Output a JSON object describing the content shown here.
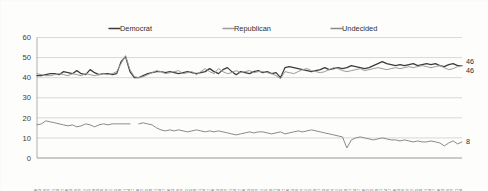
{
  "chart_data": {
    "type": "line",
    "title": "",
    "xlabel": "",
    "ylabel": "",
    "ylim": [
      0,
      60
    ],
    "yticks": [
      0,
      10,
      20,
      30,
      40,
      50,
      60
    ],
    "grid": true,
    "legend_position": "top",
    "legend": [
      "Democrat",
      "Republican",
      "Undecided"
    ],
    "end_labels": [
      {
        "series": "Democrat",
        "value": "46"
      },
      {
        "series": "Republican",
        "value": "46"
      },
      {
        "series": "Undecided",
        "value": "8"
      }
    ],
    "categories": [
      "1/20",
      "1/23",
      "1/26",
      "1/29",
      "2/1",
      "2/4",
      "2/7",
      "2/10",
      "2/13",
      "2/16",
      "2/19",
      "2/22",
      "2/25",
      "2/28",
      "3/3",
      "3/6",
      "3/9",
      "3/12",
      "3/15",
      "3/18",
      "3/21",
      "3/24",
      "3/27",
      "3/30",
      "4/2",
      "4/5",
      "4/8",
      "4/11",
      "4/14",
      "4/17",
      "4/20",
      "4/23",
      "4/26",
      "4/29",
      "5/2",
      "5/5",
      "5/8",
      "5/11",
      "5/14",
      "5/17",
      "5/20",
      "5/23",
      "5/26",
      "5/29",
      "6/1",
      "6/4",
      "6/7",
      "6/10",
      "6/13",
      "6/16",
      "6/19",
      "6/22",
      "6/25",
      "6/28",
      "7/1",
      "7/4",
      "7/7",
      "7/10",
      "7/13",
      "7/16",
      "7/19",
      "7/22",
      "7/25",
      "7/28",
      "7/31",
      "8/3",
      "8/6",
      "8/9",
      "8/12",
      "8/15",
      "8/18",
      "8/21",
      "8/24",
      "8/27",
      "8/30",
      "9/2",
      "9/5",
      "9/8",
      "9/11",
      "9/14",
      "9/17",
      "9/20",
      "9/23",
      "9/26",
      "9/29",
      "10/2",
      "10/5",
      "10/8",
      "10/11",
      "10/14",
      "10/17",
      "10/20",
      "10/23",
      "10/26",
      "10/29",
      "11/1",
      "11/4"
    ],
    "series": [
      {
        "name": "Democrat",
        "color": "#3c3c3c",
        "values": [
          41,
          41,
          41.5,
          42,
          42,
          41.5,
          43,
          42.5,
          42,
          43.5,
          42,
          41.5,
          44,
          42.5,
          41.5,
          42,
          42,
          41.5,
          42,
          48,
          50.5,
          43,
          40,
          40,
          41,
          42,
          42.5,
          43,
          43,
          42.5,
          43,
          42.5,
          42,
          42.5,
          43,
          42.5,
          42,
          42.5,
          43,
          44.5,
          43,
          42,
          44,
          45,
          43,
          41.5,
          43,
          42.5,
          42,
          43,
          43.5,
          42.5,
          43,
          42,
          42.5,
          40,
          45,
          45.5,
          45,
          44.5,
          44,
          43.5,
          43,
          43.5,
          44,
          45,
          44,
          44.5,
          45,
          44.5,
          45,
          46,
          45.5,
          45,
          44.5,
          45,
          46,
          47,
          48,
          47,
          46.5,
          46,
          46.5,
          46,
          46.5,
          47,
          46,
          46.5,
          47,
          46.5,
          47,
          46,
          45.5,
          46.5,
          47,
          46,
          46
        ]
      },
      {
        "name": "Republican",
        "color": "#9b9b9b",
        "values": [
          42,
          41.5,
          41,
          41,
          41.5,
          42,
          41.5,
          41,
          42,
          41.5,
          41,
          42,
          41.5,
          41,
          41.5,
          42,
          41.5,
          42,
          43,
          47,
          51,
          44,
          40.5,
          40,
          40.5,
          41.5,
          42.5,
          43.5,
          43,
          42,
          42.5,
          43,
          43.5,
          42,
          42.5,
          43,
          41.5,
          43,
          44.5,
          43,
          42,
          44.5,
          43,
          42,
          42.5,
          43.5,
          42.5,
          43,
          43.5,
          42.5,
          43,
          43,
          42.5,
          42,
          41,
          39.5,
          43,
          42.5,
          42,
          43,
          44,
          44.5,
          43.5,
          43,
          42.5,
          43,
          44,
          45,
          44.5,
          43.5,
          43,
          43.5,
          44,
          44.5,
          43.5,
          44,
          44.5,
          45,
          44.5,
          44,
          44.5,
          45,
          44.5,
          45,
          45.5,
          45,
          45.5,
          46,
          45.5,
          45,
          45.5,
          46,
          45,
          44,
          44.5,
          45.5,
          46
        ]
      },
      {
        "name": "Undecided",
        "color": "#8a8a8a",
        "gap_after_index": 21,
        "values": [
          16.5,
          17,
          18.5,
          18,
          17.5,
          17,
          16.5,
          16,
          16.5,
          15.5,
          16,
          17,
          16.5,
          15.5,
          16.5,
          17,
          16.5,
          17,
          17,
          17,
          17,
          17,
          null,
          17,
          17.5,
          17,
          16.5,
          15,
          14,
          13.5,
          14,
          13.5,
          14,
          13.5,
          13,
          13.5,
          14,
          13.5,
          13,
          13.5,
          13,
          13.5,
          13,
          12.5,
          12,
          11.5,
          12,
          12.5,
          13,
          12.5,
          13,
          13,
          12.5,
          12,
          12.5,
          13,
          12,
          12.5,
          13,
          13.5,
          13,
          13.5,
          14,
          13.5,
          13,
          12.5,
          12,
          11.5,
          11,
          10.5,
          5,
          9,
          10,
          10.5,
          10,
          9.5,
          9,
          9.5,
          10,
          9.5,
          9,
          9,
          8.5,
          9,
          8.5,
          8,
          8.5,
          8,
          8,
          8.5,
          8,
          7.5,
          6,
          7.5,
          8.5,
          7,
          8
        ]
      }
    ]
  }
}
